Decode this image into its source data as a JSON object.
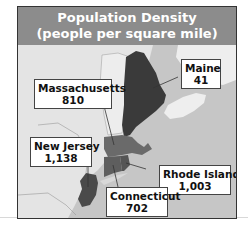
{
  "title": {
    "line1": "Population Density",
    "line2": "(people per square mile)"
  },
  "states": [
    {
      "name": "Maine",
      "value": "41"
    },
    {
      "name": "Massachusetts",
      "value": "810"
    },
    {
      "name": "New Jersey",
      "value": "1,138"
    },
    {
      "name": "Rhode Island",
      "value": "1,003"
    },
    {
      "name": "Connecticut",
      "value": "702"
    }
  ],
  "colors": {
    "title_bg": "#8c8c8c",
    "land": "#e6e6e6",
    "water": "#c4c4c4",
    "maine": "#3a3a3a",
    "massachusetts": "#6a6a6a",
    "connecticut": "#5e5e5e",
    "rhode_island": "#555555",
    "new_jersey": "#4a4a4a",
    "canada_land": "#ededed"
  }
}
